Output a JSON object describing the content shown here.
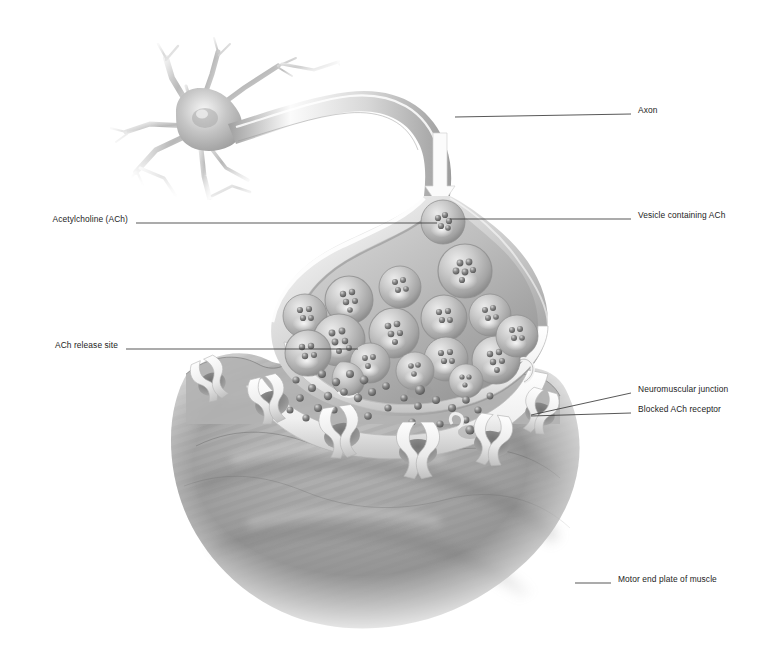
{
  "figure": {
    "background_color": "#ffffff",
    "ink_color": "#1c1c1c",
    "palette": {
      "neuron_light": "#f2f2f2",
      "neuron_mid": "#c9c9c9",
      "neuron_shadow": "#8e8e8e",
      "vesicle_fill": "#bdbdbd",
      "vesicle_rim": "#9a9a9a",
      "ach_dot": "#6f6f6f",
      "muscle_gray": "#a6a6a6",
      "muscle_dark": "#7d7d7d",
      "receptor_white": "#fbfbfb",
      "leader_line": "#3a3a3a"
    }
  },
  "labels": [
    {
      "id": "axon",
      "text": "Axon",
      "side": "right",
      "text_x": 638,
      "text_y": 110,
      "leader": {
        "x1": 455,
        "y1": 117,
        "x2": 631,
        "y2": 114
      }
    },
    {
      "id": "vesicle-containing-ach",
      "text": "Vesicle containing ACh",
      "side": "right",
      "text_x": 638,
      "text_y": 215,
      "leader": {
        "x1": 450,
        "y1": 219,
        "x2": 631,
        "y2": 219
      }
    },
    {
      "id": "acetylcholine-ach",
      "text": "Acetylcholine (ACh)",
      "side": "left",
      "text_x": 128,
      "text_y": 219,
      "leader": {
        "x1": 136,
        "y1": 223,
        "x2": 437,
        "y2": 223
      }
    },
    {
      "id": "ach-release-site",
      "text": "ACh release site",
      "side": "left",
      "text_x": 118,
      "text_y": 345,
      "leader": {
        "x1": 126,
        "y1": 349,
        "x2": 358,
        "y2": 349
      }
    },
    {
      "id": "neuromuscular-junction",
      "text": "Neuromuscular junction",
      "side": "right",
      "text_x": 638,
      "text_y": 389,
      "leader": {
        "x1": 531,
        "y1": 415,
        "x2": 631,
        "y2": 393
      }
    },
    {
      "id": "blocked-ach-receptor",
      "text": "Blocked ACh receptor",
      "side": "right",
      "text_x": 638,
      "text_y": 409,
      "leader": {
        "x1": 531,
        "y1": 416,
        "x2": 631,
        "y2": 413
      }
    },
    {
      "id": "motor-end-plate-of-muscle",
      "text": "Motor end plate of muscle",
      "side": "right",
      "text_x": 618,
      "text_y": 579,
      "leader": {
        "x1": 575,
        "y1": 583,
        "x2": 611,
        "y2": 583
      }
    }
  ],
  "structures": {
    "neuron_soma": "cell body with radiating dendrites, upper left",
    "axon": "long tapering process curving right then down into terminal",
    "impulse_arrow": "white downward arrow inside axon indicating impulse direction",
    "axon_terminal": "bulbous synaptic end bulb, cut open to reveal interior",
    "synaptic_vesicles_count": 16,
    "free_ach_molecules": "dark spheres scattered in the synaptic cleft",
    "receptors_count": 6,
    "junctional_folds": "infoldings of the muscle sarcolemma",
    "muscle": "motor end plate, large mottled gray mass at bottom"
  }
}
